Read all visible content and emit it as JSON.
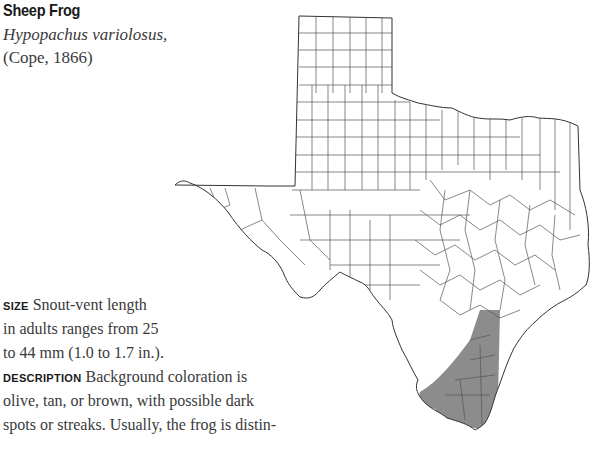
{
  "header": {
    "common_name": "Sheep Frog",
    "scientific_name": "Hypopachus variolosus,",
    "authority": "(Cope, 1866)"
  },
  "size": {
    "label": "SIZE",
    "lines": [
      "Snout-vent length",
      "in adults ranges from 25",
      "to 44 mm (1.0 to 1.7 in.)."
    ]
  },
  "description": {
    "label": "DESCRIPTION",
    "lines": [
      "Background coloration is",
      "olive, tan, or brown, with possible dark",
      "spots or streaks. Usually, the frog is distin-"
    ]
  },
  "map": {
    "region": "Texas",
    "subdivisions": "counties",
    "range_area": "South Texas coastal counties",
    "range_color": "#8c8c8c",
    "outline_color": "#333333"
  }
}
